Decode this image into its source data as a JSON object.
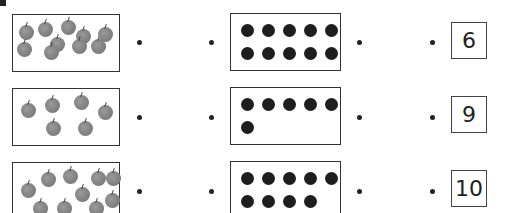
{
  "worksheet": {
    "rows": [
      {
        "apples_count": 9,
        "apples": [
          [
            6,
            10
          ],
          [
            25,
            7
          ],
          [
            48,
            5
          ],
          [
            63,
            14
          ],
          [
            37,
            22
          ],
          [
            59,
            24
          ],
          [
            4,
            27
          ],
          [
            31,
            30
          ],
          [
            78,
            24
          ],
          [
            85,
            12
          ]
        ],
        "dots_count": 10,
        "number": "6"
      },
      {
        "apples_count": 6,
        "apples": [
          [
            8,
            14
          ],
          [
            32,
            9
          ],
          [
            61,
            6
          ],
          [
            85,
            16
          ],
          [
            33,
            32
          ],
          [
            65,
            32
          ]
        ],
        "dots_count": 6,
        "number": "9"
      },
      {
        "apples_count": 10,
        "apples": [
          [
            8,
            20
          ],
          [
            28,
            9
          ],
          [
            50,
            6
          ],
          [
            62,
            24
          ],
          [
            78,
            8
          ],
          [
            93,
            8
          ],
          [
            20,
            38
          ],
          [
            44,
            38
          ],
          [
            76,
            38
          ],
          [
            92,
            30
          ]
        ],
        "dots_count": 9,
        "number": "10"
      }
    ],
    "colors": {
      "ink": "#222222",
      "apple": "#808080",
      "dot": "#1e1e1e"
    }
  }
}
